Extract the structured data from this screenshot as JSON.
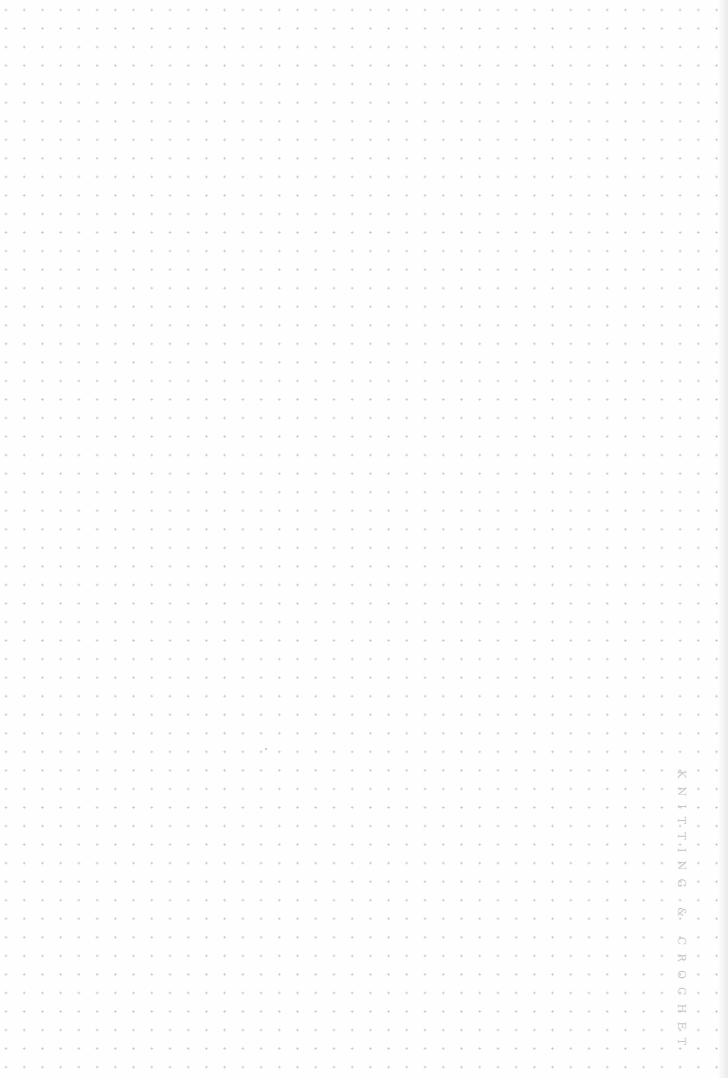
{
  "page": {
    "type": "dot-grid notebook page",
    "background_color": "#fefefe",
    "dot_color": "#c9c9c9"
  },
  "spine_label": {
    "text": "KNITTING & CROCHET",
    "color": "#c6c6c6",
    "orientation": "vertical"
  }
}
